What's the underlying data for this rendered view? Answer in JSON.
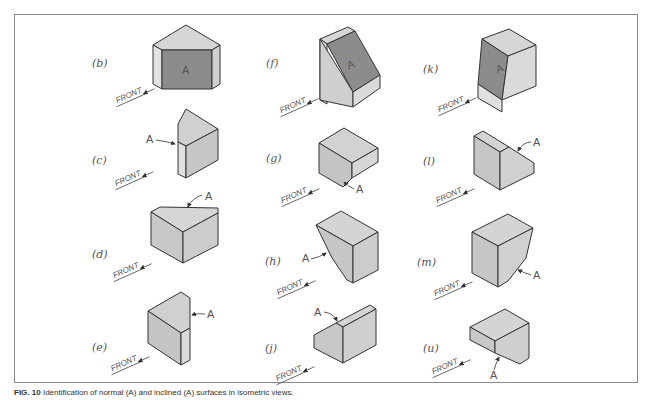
{
  "figure": {
    "caption": {
      "number": "FIG. 10",
      "text": "Identification of normal (A) and inclined (A) surfaces in isometric views."
    },
    "front_label": "FRONT",
    "surface_label": "A",
    "colors": {
      "frame": "#8a8a8a",
      "face_light": "#d6d6d6",
      "face_mid": "#c4c4c4",
      "face_dark": "#8c8c8c",
      "edge": "#333333"
    },
    "panels": [
      {
        "id": "b",
        "label": "(b)"
      },
      {
        "id": "c",
        "label": "(c)"
      },
      {
        "id": "d",
        "label": "(d)"
      },
      {
        "id": "e",
        "label": "(e)"
      },
      {
        "id": "f",
        "label": "(f)"
      },
      {
        "id": "g",
        "label": "(g)"
      },
      {
        "id": "h",
        "label": "(h)"
      },
      {
        "id": "j",
        "label": "(j)"
      },
      {
        "id": "k",
        "label": "(k)"
      },
      {
        "id": "l",
        "label": "(l)"
      },
      {
        "id": "m",
        "label": "(m)"
      },
      {
        "id": "u",
        "label": "(u)"
      }
    ]
  }
}
